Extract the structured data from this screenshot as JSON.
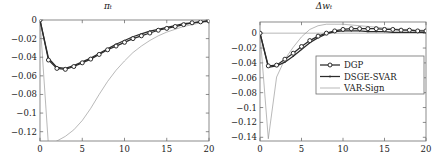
{
  "figure": {
    "background": "#ffffff",
    "frame_color": "#6e6e6e",
    "line_color": "#2b2b2b",
    "thin_line_color": "#8a8a8a"
  },
  "chart_data": [
    {
      "type": "line",
      "panel": "left",
      "title": "πₜ",
      "xlabel": "",
      "ylabel": "",
      "xlim": [
        0,
        20
      ],
      "ylim": [
        -0.13,
        0.0
      ],
      "grid": false,
      "legend": "none",
      "xticks": [
        0,
        5,
        10,
        15,
        20
      ],
      "xticklabels": [
        "0",
        "5",
        "10",
        "15",
        "20"
      ],
      "yticks": [
        0,
        -0.02,
        -0.04,
        -0.06,
        -0.08,
        -0.1,
        -0.12
      ],
      "yticklabels": [
        "0",
        "−0.02",
        "−0.04",
        "−0.06",
        "−0.08",
        "−0.1",
        "−0.12"
      ],
      "x": [
        0,
        1,
        2,
        3,
        4,
        5,
        6,
        7,
        8,
        9,
        10,
        11,
        12,
        13,
        14,
        15,
        16,
        17,
        18,
        19,
        20
      ],
      "series": [
        {
          "name": "DGP",
          "marker": "circle",
          "values": [
            0.0,
            -0.043,
            -0.052,
            -0.053,
            -0.05,
            -0.046,
            -0.042,
            -0.037,
            -0.032,
            -0.028,
            -0.024,
            -0.02,
            -0.017,
            -0.014,
            -0.011,
            -0.009,
            -0.007,
            -0.005,
            -0.003,
            -0.002,
            -0.001
          ]
        },
        {
          "name": "DSGE-SVAR",
          "marker": "dot",
          "values": [
            0.0,
            -0.041,
            -0.051,
            -0.052,
            -0.049,
            -0.045,
            -0.041,
            -0.036,
            -0.031,
            -0.026,
            -0.022,
            -0.018,
            -0.015,
            -0.012,
            -0.01,
            -0.008,
            -0.006,
            -0.004,
            -0.003,
            -0.002,
            -0.001
          ]
        },
        {
          "name": "VAR-Sign",
          "marker": "none",
          "values": [
            0.0,
            -0.135,
            -0.13,
            -0.125,
            -0.118,
            -0.108,
            -0.095,
            -0.08,
            -0.066,
            -0.054,
            -0.044,
            -0.035,
            -0.028,
            -0.022,
            -0.017,
            -0.013,
            -0.01,
            -0.007,
            -0.005,
            -0.003,
            -0.002
          ]
        }
      ]
    },
    {
      "type": "line",
      "panel": "right",
      "title": "Δwₜ",
      "xlabel": "",
      "ylabel": "",
      "xlim": [
        0,
        20
      ],
      "ylim": [
        -0.145,
        0.015
      ],
      "grid": false,
      "legend": "upper right",
      "xticks": [
        0,
        5,
        10,
        15,
        20
      ],
      "xticklabels": [
        "0",
        "5",
        "10",
        "15",
        "20"
      ],
      "yticks": [
        0,
        -0.02,
        -0.04,
        -0.06,
        -0.08,
        -0.1,
        -0.12,
        -0.14
      ],
      "yticklabels": [
        "0",
        "−0.02",
        "−0.04",
        "−0.06",
        "−0.08",
        "−0.1",
        "−0.12",
        "−0.14"
      ],
      "x": [
        0,
        1,
        2,
        3,
        4,
        5,
        6,
        7,
        8,
        9,
        10,
        11,
        12,
        13,
        14,
        15,
        16,
        17,
        18,
        19,
        20
      ],
      "series": [
        {
          "name": "DGP",
          "marker": "circle",
          "values": [
            0.0,
            -0.044,
            -0.043,
            -0.035,
            -0.027,
            -0.018,
            -0.01,
            -0.004,
            0.0,
            0.003,
            0.005,
            0.006,
            0.006,
            0.006,
            0.006,
            0.005,
            0.005,
            0.004,
            0.004,
            0.003,
            0.003
          ]
        },
        {
          "name": "DSGE-SVAR",
          "marker": "dot",
          "values": [
            0.0,
            -0.046,
            -0.044,
            -0.039,
            -0.031,
            -0.022,
            -0.013,
            -0.006,
            -0.001,
            0.002,
            0.003,
            0.003,
            0.003,
            0.002,
            0.002,
            0.002,
            0.001,
            0.001,
            0.001,
            0.001,
            0.001
          ]
        },
        {
          "name": "VAR-Sign",
          "marker": "none",
          "values": [
            0.0,
            -0.142,
            -0.059,
            -0.035,
            -0.019,
            -0.005,
            0.005,
            0.01,
            0.012,
            0.012,
            0.012,
            0.011,
            0.01,
            0.009,
            0.008,
            0.007,
            0.006,
            0.005,
            0.005,
            0.004,
            0.004
          ]
        }
      ],
      "legend_entries": [
        {
          "label": "DGP",
          "marker": "circle"
        },
        {
          "label": "DSGE-SVAR",
          "marker": "dot"
        },
        {
          "label": "VAR-Sign",
          "marker": "none"
        }
      ]
    }
  ]
}
